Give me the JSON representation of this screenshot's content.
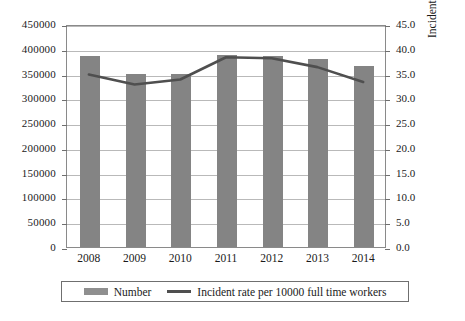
{
  "chart_data": {
    "type": "bar",
    "title": "",
    "xlabel": "",
    "ylabel": "",
    "categories": [
      "2008",
      "2009",
      "2010",
      "2011",
      "2012",
      "2013",
      "2014"
    ],
    "grid": true,
    "legend_position": "bottom",
    "series": [
      {
        "name": "Number",
        "type": "bar",
        "axis": "left",
        "color": "#848484",
        "values": [
          385000,
          350000,
          350000,
          387000,
          385000,
          380000,
          365000
        ]
      },
      {
        "name": "Incident rate per 10000 full time workers",
        "type": "line",
        "axis": "right",
        "color": "#4f4f4f",
        "values": [
          35.0,
          33.0,
          34.0,
          38.5,
          38.3,
          36.5,
          33.5
        ]
      }
    ],
    "left_axis": {
      "label": "",
      "ylim": [
        0,
        450000
      ],
      "tick_step": 50000,
      "ticks": [
        "450000",
        "400000",
        "350000",
        "300000",
        "250000",
        "200000",
        "150000",
        "100000",
        "50000",
        "0"
      ]
    },
    "right_axis": {
      "label": "Incident rate per 10000 full time workers",
      "ylim": [
        0,
        45
      ],
      "tick_step": 5,
      "ticks": [
        "45.0",
        "40.0",
        "35.0",
        "30.0",
        "25.0",
        "20.0",
        "15.0",
        "10.0",
        "5.0",
        "0.0"
      ]
    }
  },
  "legend": {
    "entries": [
      {
        "label": "Number"
      },
      {
        "label": "Incident rate per 10000 full time workers"
      }
    ]
  }
}
